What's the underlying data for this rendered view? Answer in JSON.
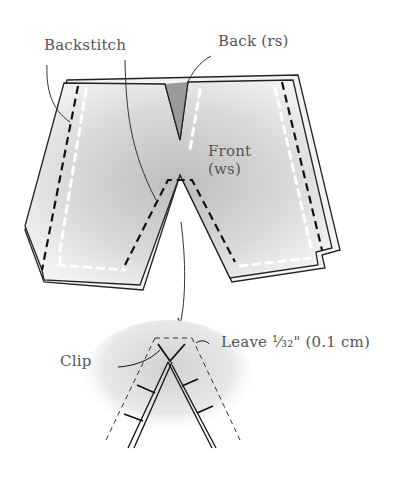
{
  "diagram": {
    "labels": {
      "backstitch": "Backstitch",
      "back_rs": "Back (rs)",
      "front_line1": "Front",
      "front_line2": "(ws)",
      "clip": "Clip",
      "leave": "Leave ¹⁄₃₂\" (0.1 cm)"
    },
    "colors": {
      "ink": "#222222",
      "text": "#555555",
      "fabric_shade": "#c8c8c8"
    }
  }
}
